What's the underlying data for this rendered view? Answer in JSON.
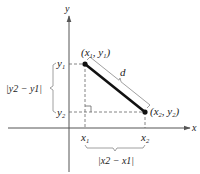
{
  "diagram": {
    "axes": {
      "x_label": "x",
      "y_label": "y"
    },
    "points": [
      {
        "id": "p1",
        "label_x": "x",
        "label_x_sub": "1",
        "label_y": "y",
        "label_y_sub": "1",
        "display": "(x1, y1)"
      },
      {
        "id": "p2",
        "label_x": "x",
        "label_x_sub": "2",
        "label_y": "y",
        "label_y_sub": "2",
        "display": "(x2, y2)"
      }
    ],
    "segment_label": "d",
    "tick_labels": {
      "x1": {
        "base": "x",
        "sub": "1"
      },
      "x2": {
        "base": "x",
        "sub": "2"
      },
      "y1": {
        "base": "y",
        "sub": "1"
      },
      "y2": {
        "base": "y",
        "sub": "2"
      }
    },
    "horizontal_distance": "|x2 − x1|",
    "vertical_distance": "|y2 − y1|",
    "colors": {
      "axis": "#555555",
      "segment": "#111111",
      "dashed": "#666666",
      "bracket": "#888888",
      "text": "#222222"
    }
  }
}
